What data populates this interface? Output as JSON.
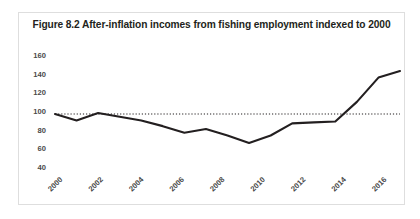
{
  "figure": {
    "title": "Figure 8.2 After-inflation incomes from fishing employment indexed to 2000"
  },
  "chart_data": {
    "type": "line",
    "title": "Figure 8.2 After-inflation incomes from fishing employment indexed to 2000",
    "xlabel": "",
    "ylabel": "",
    "x": [
      2000,
      2001,
      2002,
      2003,
      2004,
      2005,
      2006,
      2007,
      2008,
      2009,
      2010,
      2011,
      2012,
      2013,
      2014,
      2015,
      2016
    ],
    "categories": [
      "2000",
      "2001",
      "2002",
      "2003",
      "2004",
      "2005",
      "2006",
      "2007",
      "2008",
      "2009",
      "2010",
      "2011",
      "2012",
      "2013",
      "2014",
      "2015",
      "2016"
    ],
    "values": [
      100,
      93,
      101,
      97,
      93,
      87,
      80,
      84,
      77,
      69,
      77,
      90,
      91,
      92,
      113,
      139,
      146
    ],
    "series": [
      {
        "name": "Index (2000 = 100)",
        "values": [
          100,
          93,
          101,
          97,
          93,
          87,
          80,
          84,
          77,
          69,
          77,
          90,
          91,
          92,
          113,
          139,
          146
        ],
        "color": "#231f20",
        "style": "solid"
      }
    ],
    "reference_lines": [
      {
        "name": "baseline-100",
        "value": 100,
        "orientation": "horizontal",
        "style": "dotted",
        "color": "#231f20"
      }
    ],
    "ylim": [
      40,
      160
    ],
    "yticks": [
      40,
      60,
      80,
      100,
      120,
      140,
      160
    ],
    "ytick_labels": [
      "40",
      "60",
      "80",
      "100",
      "120",
      "140",
      "160"
    ],
    "xlim": [
      2000,
      2016
    ],
    "xticks": [
      2000,
      2002,
      2004,
      2006,
      2008,
      2010,
      2012,
      2014,
      2016
    ],
    "xtick_labels": [
      "2000",
      "2002",
      "2004",
      "2006",
      "2008",
      "2010",
      "2012",
      "2014",
      "2016"
    ],
    "xtick_rotation": 45,
    "grid": false,
    "legend": false,
    "legend_position": "none"
  },
  "axis": {
    "y_labels": [
      "160",
      "140",
      "120",
      "100",
      "80",
      "60",
      "40"
    ],
    "x_labels": [
      "2000",
      "2002",
      "2004",
      "2006",
      "2008",
      "2010",
      "2012",
      "2014",
      "2016"
    ]
  },
  "colors": {
    "line": "#231f20",
    "reference": "#231f20",
    "tick_text": "#4a4a4a",
    "title_text": "#231f20",
    "frame": "#dedede",
    "background": "#ffffff"
  }
}
